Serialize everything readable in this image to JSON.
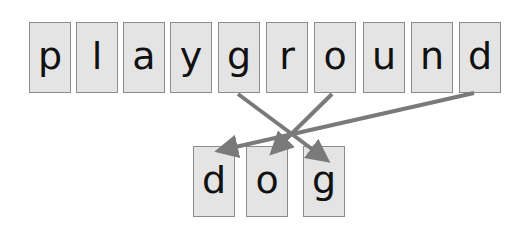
{
  "source_word": {
    "letters": [
      "p",
      "l",
      "a",
      "y",
      "g",
      "r",
      "o",
      "u",
      "n",
      "d"
    ]
  },
  "target_word": {
    "letters": [
      "d",
      "o",
      "g"
    ]
  },
  "arrows": [
    {
      "from_letter": "g",
      "from_index": 4,
      "to_index": 2
    },
    {
      "from_letter": "o",
      "from_index": 6,
      "to_index": 1
    },
    {
      "from_letter": "d",
      "from_index": 9,
      "to_index": 0
    }
  ],
  "colors": {
    "tile_fill": "#e4e4e4",
    "tile_border": "#8c8c8c",
    "arrow": "#7a7a7a",
    "text": "#111111"
  }
}
